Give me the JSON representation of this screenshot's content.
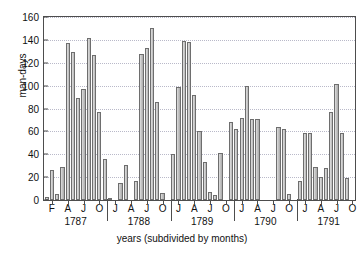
{
  "chart_data": {
    "type": "bar",
    "title": "",
    "xlabel": "years (subdivided by months)",
    "ylabel": "man-days",
    "ylim": [
      0,
      160
    ],
    "ytick_values": [
      0,
      20,
      40,
      60,
      80,
      100,
      120,
      140,
      160
    ],
    "ytick_labels": [
      "0",
      "20",
      "40",
      "60",
      "80",
      "100",
      "120",
      "140",
      "160"
    ],
    "grid": "horizontal-dotted",
    "legend": "none",
    "xtick_labels": [
      "F",
      "A",
      "J",
      "O",
      "J",
      "A",
      "J",
      "O",
      "J",
      "A",
      "J",
      "O",
      "J",
      "A",
      "J",
      "O",
      "J",
      "A",
      "J",
      "O",
      "J"
    ],
    "year_groups": [
      "1787",
      "1788",
      "1789",
      "1790",
      "1791"
    ],
    "bar_color": "#b8b8b8",
    "bar_edge_color": "#6e6e6e",
    "categories": [
      "1787-F",
      "1787-M",
      "1787-A",
      "1787-M",
      "1787-J",
      "1787-J",
      "1787-A",
      "1787-S",
      "1787-O",
      "1787-N",
      "1787-D",
      "1788-J",
      "1788-F",
      "1788-M",
      "1788-A",
      "1788-M",
      "1788-J",
      "1788-J",
      "1788-A",
      "1788-S",
      "1788-O",
      "1788-N",
      "1788-D",
      "1789-J",
      "1789-F",
      "1789-M",
      "1789-A",
      "1789-M",
      "1789-J",
      "1789-J",
      "1789-A",
      "1789-S",
      "1789-O",
      "1789-N",
      "1789-D",
      "1790-J",
      "1790-F",
      "1790-M",
      "1790-A",
      "1790-M",
      "1790-J",
      "1790-J",
      "1790-A",
      "1790-S",
      "1790-O",
      "1790-N",
      "1790-D",
      "1791-J",
      "1791-F",
      "1791-M",
      "1791-A",
      "1791-M",
      "1791-J",
      "1791-J",
      "1791-A",
      "1791-S",
      "1791-O",
      "1791-N",
      "1791-D"
    ],
    "values": [
      3,
      26,
      5,
      29,
      137,
      129,
      89,
      97,
      142,
      127,
      77,
      36,
      2,
      0,
      15,
      31,
      0,
      17,
      128,
      133,
      150,
      86,
      6,
      0,
      40,
      99,
      139,
      138,
      92,
      60,
      33,
      7,
      4,
      41,
      0,
      68,
      62,
      72,
      100,
      71,
      71,
      0,
      0,
      0,
      64,
      62,
      5,
      0,
      17,
      59,
      59,
      29,
      20,
      28,
      77,
      101,
      59,
      19,
      0
    ]
  }
}
